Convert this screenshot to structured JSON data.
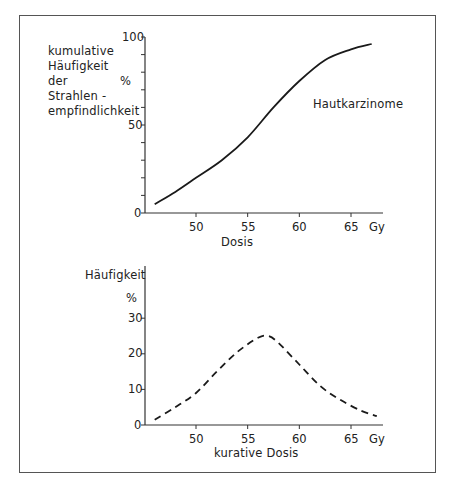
{
  "chart_data": [
    {
      "type": "line",
      "title": "",
      "ylabel_lines": [
        "kumulative",
        "Häufigkeit",
        "der",
        "Strahlen -",
        "empfindlichkeit"
      ],
      "ylabel_unit": "%",
      "xlabel": "Dosis",
      "x_unit": "Gy",
      "annotation": "Hautkarzinome",
      "xlim": [
        45,
        68
      ],
      "ylim": [
        0,
        100
      ],
      "x_ticks": [
        50,
        55,
        60,
        65
      ],
      "y_tick_labels": [
        0,
        50,
        100
      ],
      "y_minor_tick_step": 10,
      "grid": false,
      "line_style": "solid",
      "series": [
        {
          "name": "Hautkarzinome (kumulativ)",
          "x": [
            46,
            48,
            50,
            52.5,
            55,
            57.5,
            60,
            62.5,
            65,
            67
          ],
          "y": [
            5,
            12,
            20,
            30,
            43,
            60,
            75,
            87,
            93,
            96
          ]
        }
      ]
    },
    {
      "type": "line",
      "title": "",
      "ylabel": "Häufigkeit",
      "ylabel_unit": "%",
      "xlabel": "kurative Dosis",
      "x_unit": "Gy",
      "xlim": [
        45,
        68
      ],
      "ylim": [
        0,
        40
      ],
      "x_ticks": [
        50,
        55,
        60,
        65
      ],
      "y_tick_labels": [
        0,
        10,
        20,
        30
      ],
      "grid": false,
      "line_style": "dashed",
      "series": [
        {
          "name": "Häufigkeit kurative Dosis",
          "x": [
            46,
            48,
            50,
            52,
            54,
            56,
            57,
            58,
            60,
            62,
            64,
            66,
            67.5
          ],
          "y": [
            1.5,
            5,
            9,
            15,
            20.5,
            24.5,
            25,
            23,
            17,
            11,
            7,
            4,
            2.5
          ]
        }
      ]
    }
  ],
  "top": {
    "ylabel_lines": [
      "kumulative",
      "Häufigkeit",
      "der",
      "Strahlen -",
      "empfindlichkeit"
    ],
    "unit": "%",
    "y_ticks": [
      "100",
      "50",
      "0"
    ],
    "x_ticks": [
      "50",
      "55",
      "60",
      "65"
    ],
    "x_unit": "Gy",
    "xlabel": "Dosis",
    "annotation": "Hautkarzinome"
  },
  "bottom": {
    "ylabel": "Häufigkeit",
    "unit": "%",
    "y_ticks": [
      "30",
      "20",
      "10",
      "0"
    ],
    "x_ticks": [
      "50",
      "55",
      "60",
      "65"
    ],
    "x_unit": "Gy",
    "xlabel": "kurative Dosis"
  },
  "colors": {
    "line": "#1a1a1a",
    "axis": "#333333",
    "frame": "#555555"
  }
}
